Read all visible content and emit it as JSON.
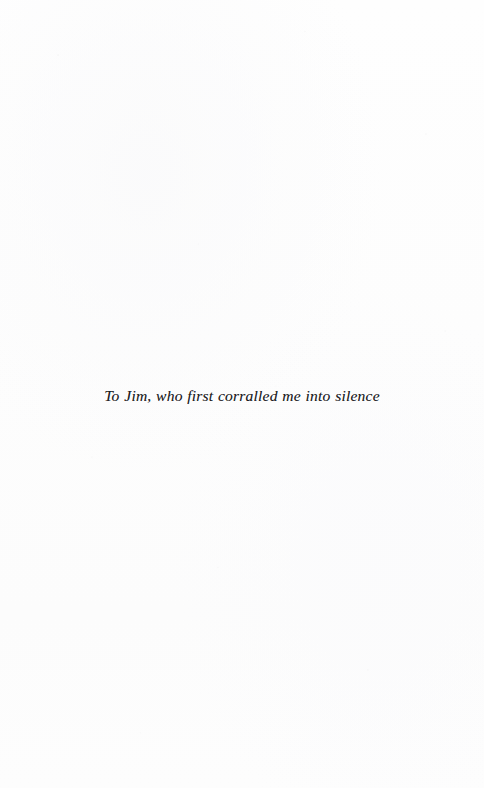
{
  "page": {
    "kind": "book-dedication-page",
    "width": 484,
    "height": 788,
    "background_color": "#fdfdfd",
    "ink_color": "#1b1b1d"
  },
  "dedication": {
    "text": "To Jim, who first corralled me into silence"
  }
}
